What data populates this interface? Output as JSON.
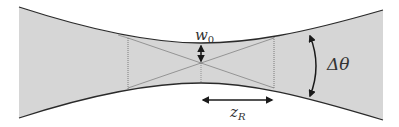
{
  "diagram": {
    "colors": {
      "beam_fill": "#d6d6d6",
      "outline": "#2a2a2a",
      "guide_lines": "#777777",
      "background": "#ffffff"
    },
    "labels": {
      "waist": {
        "symbol": "w",
        "subscript": "0"
      },
      "rayleigh_range": {
        "symbol": "z",
        "subscript": "R"
      },
      "divergence": {
        "symbol": "Δθ"
      }
    }
  }
}
